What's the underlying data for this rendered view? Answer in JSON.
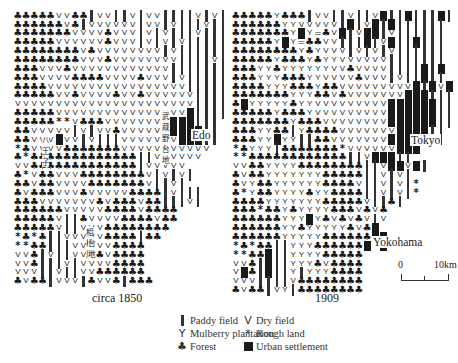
{
  "figure": {
    "maps": [
      {
        "id": "left",
        "caption": "circa 1850",
        "labels": {
          "city": "Edo",
          "jp_plateau_musashino": "武蔵野台地",
          "jp_hachioji": "八王子",
          "jp_sagamihara_1": "相模原",
          "jp_sagamihara_2": "台地"
        },
        "rows": [
          "FFFFFVVFFPVVPPVPVVPPPPVPVP",
          "FFFFFFVFPVVVVVVPVVPVPPPVPP",
          "FFFFFFFVVVVFVVVPVPVPPPVPPP",
          "FFFFFVVVVVVFVVVPVPVPVPPPPP",
          "FFFFFFFFVFVVVVVVVVPVPPPPPP",
          "FFFFFFFFVVVFVVVVVVVVPPPPVP",
          "FFFVVVFVVVVVVVVVVVVPPPPPPP",
          "FFFVVVVFFFFVVVVFVVVPVPPPPP",
          "FFFFVVVVVVVVVVVVVVVVVPPPPP",
          "FFFFFVVFVVVVFVVFVVVVVVPPPP",
          "VVVVVVVVVVVVVVVVVVVVVVPPPP",
          "FFFFFVVVVVVVVVVVVVVVVUPPPP",
          "FFFFF**VFFFVVVVVVVVUUUPPP",
          "FFVVVVVPVPVVFVVVVVVUUUUPP",
          "FFVVVUVVPVPPPVVVVVVVUUUPP",
          "*FVVVVFFFFFFFVVVVVVVVVVV",
          "F*FFFFFFFFFFFFFPPVVVVVV",
          "VVFFFFFFFFFFFFFPVVVVV",
          "F*VFFVVVFFFFFFFFVPVPVP",
          "FFVFFVVVVFFFFFFFVPPVP",
          "FVFFFVVVFVVVVVFFFFPVPPP",
          "FFFVVVVVVVFVFFFVFFPPPVP",
          "FFFFFFVVVVVFFFFVFFFF",
          "FFFFFVPPFVVVVFFFFVFF",
          "FFFFFVPPVVVFFFFFFFF",
          "*F*FPPVVVVVFFFFPFF",
          "**FFPPPVVVVVFFFF",
          "VVFPVPPVVVFVFFFF",
          "VVFPPPVPVVVVFFFF",
          "VVVPPVPPVVFFFFFF",
          "FVFFPVVVPFVVFPFFF"
        ]
      },
      {
        "id": "right",
        "caption": "1909",
        "labels": {
          "city_tokyo": "Tokyo",
          "city_yokohama": "Yokohama"
        },
        "rows": [
          "FFFFFYFFFPVVPPVPPVUPPUPPPUP",
          "FFFFFFYYVVVVVPUPVUPUPPPPPP",
          "FFFFFFFYUY=FVUPVUUPVPPPPPP",
          "FFFFFYUY=FFVVPPPUPVUPPUPPP",
          "FFFFFFFFYFYVVVPVPVPVPPPPPP",
          "FFFFFYFFFYFYYVVVVVVPPPPPPP",
          "FFFYYFYYYYYYVVFVVVVPPPPUPU",
          "FFFYYYFFFYYVVVVFVVVPVPPUPP",
          "FFFFYYYFFFYFFVVVVVVVVVUPUVU",
          "FFFFFFFYYYFFVFVVVVVVVUUUPPP",
          "FUYYYYYFYYVVVVVVVVVUUUUUUPP",
          "FFFFFYFFFYVVVVVVVVVUUUUUUPP",
          "FFFFFFFYFFFVVVVVVVVUUUUUUPP",
          "FFFYYFFPYFFFFVVVVVVVUUUUPP",
          "FFFYYUYYPPFFVVVVVVVUUUUP*P",
          "*FYYYPFFFFFFF*VVVVVVUUU",
          "**FFFFFFFFFFFFPPVUUUPP",
          "VVFFYYYYFFFFFFFFPPVUUVUP",
          "FVFFYYYYYYYFFFFFPPVPVP",
          "FVYFFYYYYYYFFFFVPPVPVP*",
          "F*YFFYYYYFYYFFFFPPVPVP*",
          "FFFFYYYYYYYFFFFFVPPFP",
          "FFF*FFYFYYYYFFFVFVF",
          "FFFFFFYYYUYFVFVFVPV",
          "FFFFFFYYFYYYYYFVFU",
          "FFFFFFYYYYYFFFFFFUU",
          "*F*FFPPYYYFFFFFFUVU",
          "**FFUPPYYYYFFFFF",
          "VVFPUPPYYYFVFFFF",
          "VUFPUPPYPYYYFFFF",
          "VVVPPPPVFFFFFFFF",
          "FVFFPVYPFFFFFFFF"
        ]
      }
    ],
    "legend": {
      "left_column": [
        {
          "symbol": "paddy-field",
          "label": "Paddy field"
        },
        {
          "symbol": "mulberry",
          "label": "Mulberry plantation"
        },
        {
          "symbol": "forest",
          "label": "Forest"
        }
      ],
      "right_column": [
        {
          "symbol": "dry-field",
          "glyph": "V",
          "label": "Dry field"
        },
        {
          "symbol": "rough-land",
          "glyph": "*",
          "label": "Rough land"
        },
        {
          "symbol": "urban",
          "label": "Urban settlement"
        }
      ]
    },
    "scale_bar": {
      "start_label": "0",
      "end_label": "10km"
    }
  }
}
